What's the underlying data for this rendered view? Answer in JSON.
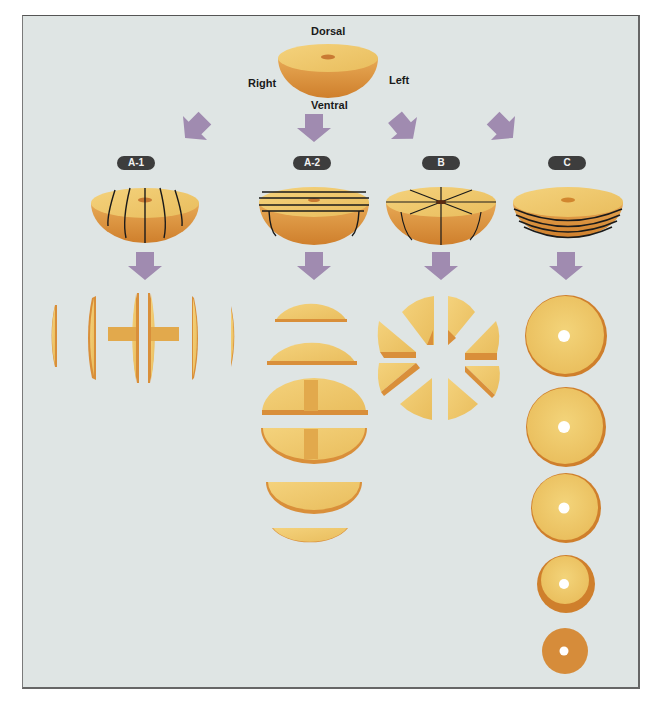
{
  "figure": {
    "orientation_labels": {
      "top": "Dorsal",
      "bottom": "Ventral",
      "left": "Right",
      "right": "Left"
    },
    "methods": [
      {
        "id": "A-1",
        "label": "A-1",
        "cut": "vertical sagittal slices",
        "pieces": 6
      },
      {
        "id": "A-2",
        "label": "A-2",
        "cut": "horizontal slices",
        "pieces": 6
      },
      {
        "id": "B",
        "label": "B",
        "cut": "radial wedges",
        "pieces": 8
      },
      {
        "id": "C",
        "label": "C",
        "cut": "coronal disc slices",
        "pieces": 5
      }
    ],
    "colors": {
      "panel_background": "#dfe5e4",
      "arrow": "#a08bb0",
      "tissue_face": "#f0c86a",
      "tissue_side": "#d98f3a",
      "badge": "#3d3d3d",
      "cut_line": "#1a1a1a"
    }
  }
}
